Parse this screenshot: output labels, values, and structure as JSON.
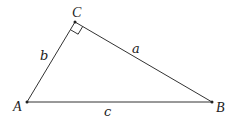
{
  "diagram": {
    "type": "right-triangle",
    "vertices": {
      "A": {
        "label": "A",
        "x": 27,
        "y": 102
      },
      "B": {
        "label": "B",
        "x": 212,
        "y": 102
      },
      "C": {
        "label": "C",
        "x": 75,
        "y": 22
      }
    },
    "sides": {
      "a": {
        "label": "a",
        "between": "C-B"
      },
      "b": {
        "label": "b",
        "between": "A-C"
      },
      "c": {
        "label": "c",
        "between": "A-B"
      }
    },
    "right_angle_at": "C",
    "colors": {
      "stroke": "#333333",
      "text": "#222222",
      "background": "#ffffff"
    }
  }
}
